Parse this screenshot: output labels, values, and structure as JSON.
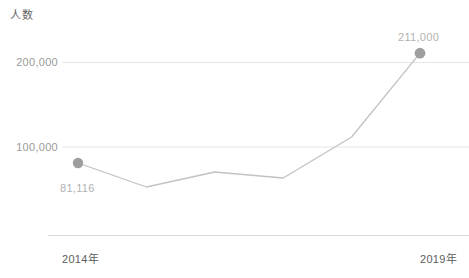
{
  "chart_data": {
    "type": "line",
    "title": "",
    "subtitle": "",
    "ylabel": "人数",
    "xlabel": "",
    "categories": [
      "2014年",
      "2015年",
      "2016年",
      "2017年",
      "2018年",
      "2019年"
    ],
    "x": [
      2014,
      2015,
      2016,
      2017,
      2018,
      2019
    ],
    "values": [
      81116,
      52700,
      70400,
      63300,
      111800,
      211000
    ],
    "series": [
      {
        "name": "人数",
        "values": [
          81116,
          52700,
          70400,
          63300,
          111800,
          211000
        ]
      }
    ],
    "point_labels": {
      "first": "81,116",
      "last": "211,000"
    },
    "ylim": [
      0,
      240000
    ],
    "y_ticks": [
      100000,
      200000
    ],
    "y_tick_labels": [
      "100,000",
      "200,000"
    ],
    "x_tick_labels_visible": [
      "2014年",
      "2019年"
    ],
    "grid": true,
    "grid_axis": "y",
    "legend": false,
    "legend_position": "none",
    "markers_shown_at": [
      "2014年",
      "2019年"
    ],
    "colors": {
      "line": "#bdbdbd",
      "marker": "#9e9e9e",
      "grid": "#e8e8e8",
      "axis": "#d8d8d8",
      "tick_text": "#9a9a9a",
      "axis_title_text": "#666666",
      "point_label_text": "#b2b2b2",
      "background": "#ffffff"
    }
  },
  "axis": {
    "y_title": "人数",
    "y_tick_200k": "200,000",
    "y_tick_100k": "100,000",
    "x_tick_start": "2014年",
    "x_tick_end": "2019年"
  },
  "labels": {
    "first_point": "81,116",
    "last_point": "211,000"
  }
}
